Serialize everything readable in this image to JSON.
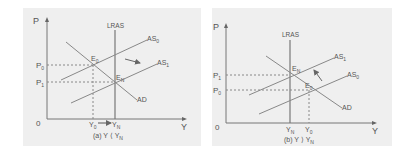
{
  "panels": [
    {
      "id": "a",
      "caption": "(a) Y ⟨ Y",
      "caption_sub": "N",
      "axes": {
        "y_label": "P",
        "x_label": "Y",
        "origin": "0"
      },
      "curves": {
        "lras": "LRAS",
        "as_initial": "AS",
        "as_initial_sub": "0",
        "as_shifted": "AS",
        "as_shifted_sub": "1",
        "ad": "AD"
      },
      "points": {
        "initial": "E",
        "initial_sub": "0",
        "final": "E",
        "final_sub": "N"
      },
      "price_levels": {
        "high": "P",
        "high_sub": "0",
        "low": "P",
        "low_sub": "1"
      },
      "output_levels": {
        "initial": "Y",
        "initial_sub": "0",
        "natural": "Y",
        "natural_sub": "N"
      },
      "shift_direction": "right/down"
    },
    {
      "id": "b",
      "caption": "(b) Y ⟩ Y",
      "caption_sub": "N",
      "axes": {
        "y_label": "P",
        "x_label": "Y",
        "origin": "0"
      },
      "curves": {
        "lras": "LRAS",
        "as_shifted": "AS",
        "as_shifted_sub": "1",
        "as_initial": "AS",
        "as_initial_sub": "0",
        "ad": "AD"
      },
      "points": {
        "final": "E",
        "final_sub": "N",
        "initial": "E",
        "initial_sub": "0"
      },
      "price_levels": {
        "high": "P",
        "high_sub": "1",
        "low": "P",
        "low_sub": "0"
      },
      "output_levels": {
        "natural": "Y",
        "natural_sub": "N",
        "initial": "Y",
        "initial_sub": "0"
      },
      "shift_direction": "left/up"
    }
  ]
}
